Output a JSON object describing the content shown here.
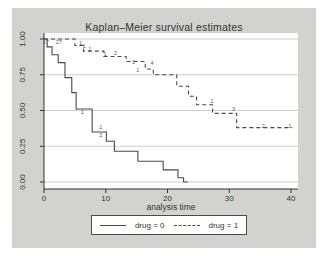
{
  "title": "Kaplan–Meier survival estimates",
  "chart_data": {
    "type": "line",
    "subtype": "kaplan-meier-step",
    "title": "Kaplan–Meier survival estimates",
    "xlabel": "analysis time",
    "ylabel": "",
    "xlim": [
      0,
      40
    ],
    "ylim": [
      0,
      1
    ],
    "xtick_values": [
      0,
      10,
      20,
      30,
      40
    ],
    "xtick_labels": [
      "0",
      "10",
      "20",
      "30",
      "40"
    ],
    "ytick_values": [
      0,
      0.25,
      0.5,
      0.75,
      1
    ],
    "ytick_labels": [
      "0.00",
      "0.25",
      "0.50",
      "0.75",
      "1.00"
    ],
    "grid": "horizontal",
    "legend_position": "bottom",
    "series": [
      {
        "name": "drug = 0",
        "style": "solid",
        "steps": [
          [
            0,
            1.0
          ],
          [
            0.5,
            0.945
          ],
          [
            1.3,
            0.89
          ],
          [
            2.3,
            0.835
          ],
          [
            3.4,
            0.73
          ],
          [
            4.5,
            0.625
          ],
          [
            5.2,
            0.51
          ],
          [
            7.8,
            0.35
          ],
          [
            10.1,
            0.285
          ],
          [
            11.4,
            0.215
          ],
          [
            15.2,
            0.145
          ],
          [
            19.3,
            0.085
          ],
          [
            21.7,
            0.03
          ],
          [
            22.6,
            0.0
          ]
        ],
        "end_t": 23.3
      },
      {
        "name": "drug = 1",
        "style": "dashed",
        "steps": [
          [
            0,
            1.0
          ],
          [
            5.0,
            0.955
          ],
          [
            6.4,
            0.915
          ],
          [
            9.7,
            0.878
          ],
          [
            13.3,
            0.843
          ],
          [
            16.4,
            0.79
          ],
          [
            17.7,
            0.75
          ],
          [
            21.5,
            0.67
          ],
          [
            23.4,
            0.6
          ],
          [
            24.7,
            0.54
          ],
          [
            27.3,
            0.48
          ],
          [
            31.2,
            0.38
          ]
        ],
        "end_t": 40.2
      }
    ],
    "censor_labels": [
      {
        "series": 0,
        "t": 0.3,
        "s": 0.975,
        "text": "17"
      },
      {
        "series": 0,
        "t": 2.4,
        "s": 0.975,
        "text": "27"
      },
      {
        "series": 0,
        "t": 6.2,
        "s": 0.487,
        "text": "1"
      },
      {
        "series": 0,
        "t": 9.2,
        "s": 0.382,
        "text": "1"
      },
      {
        "series": 0,
        "t": 9.2,
        "s": 0.322,
        "text": "2"
      },
      {
        "series": 1,
        "t": 5.9,
        "s": 0.968,
        "text": "1"
      },
      {
        "series": 1,
        "t": 6.5,
        "s": 0.944,
        "text": "1"
      },
      {
        "series": 1,
        "t": 7.4,
        "s": 0.928,
        "text": "1"
      },
      {
        "series": 1,
        "t": 9.9,
        "s": 0.89,
        "text": "1"
      },
      {
        "series": 1,
        "t": 11.6,
        "s": 0.9,
        "text": "2"
      },
      {
        "series": 1,
        "t": 14.5,
        "s": 0.832,
        "text": "1"
      },
      {
        "series": 1,
        "t": 15.2,
        "s": 0.778,
        "text": "1"
      },
      {
        "series": 1,
        "t": 17.5,
        "s": 0.826,
        "text": "4"
      },
      {
        "series": 1,
        "t": 27.2,
        "s": 0.566,
        "text": "1"
      },
      {
        "series": 1,
        "t": 30.7,
        "s": 0.507,
        "text": "3"
      },
      {
        "series": 1,
        "t": 35.5,
        "s": 0.39,
        "text": "2"
      },
      {
        "series": 1,
        "t": 39.8,
        "s": 0.39,
        "text": "1"
      }
    ]
  },
  "legend": {
    "items": [
      {
        "label": "drug = 0",
        "style": "solid"
      },
      {
        "label": "drug = 1",
        "style": "dashed"
      }
    ]
  },
  "colors": {
    "figure_background": "#d2d2cf",
    "plot_background": "#ffffff",
    "gridline": "#c7cfd2",
    "axis": "#333333",
    "curve": "#4a4a4a",
    "text": "#333333"
  }
}
